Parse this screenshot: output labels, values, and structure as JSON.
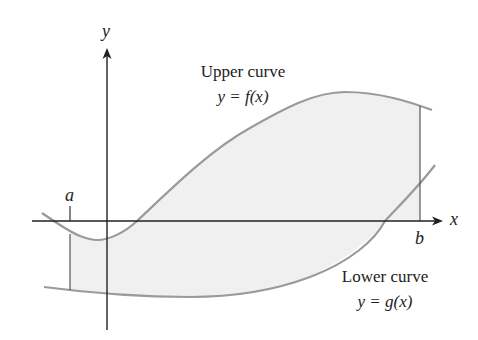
{
  "figure": {
    "axes": {
      "x_label": "x",
      "y_label": "y"
    },
    "bounds": {
      "left_label": "a",
      "right_label": "b"
    },
    "upper_curve": {
      "title": "Upper curve",
      "equation": "y = f(x)"
    },
    "lower_curve": {
      "title": "Lower curve",
      "equation": "y = g(x)"
    },
    "colors": {
      "curve": "#9a9a9a",
      "fill": "#f0f0f0",
      "axis": "#222222",
      "bound_line": "#555555",
      "text": "#222222"
    }
  }
}
